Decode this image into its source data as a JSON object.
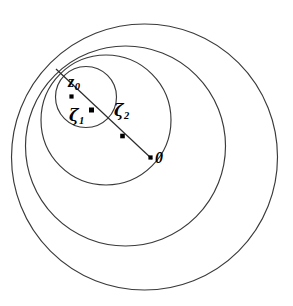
{
  "figure": {
    "kind": "geometry-diagram",
    "canvas": {
      "width": 293,
      "height": 306,
      "background": "#ffffff"
    },
    "stroke_color": "#3a3a3a",
    "marker_color": "#000000",
    "tangency_point": {
      "x": 55.0,
      "y": 68.0
    }
  },
  "circles": [
    {
      "name": "circle-z0",
      "cx": 86.0,
      "cy": 97.0,
      "r": 30.5,
      "label_ref": "z0"
    },
    {
      "name": "circle-zeta1",
      "cx": 106.0,
      "cy": 120.0,
      "r": 65.0,
      "label_ref": "zeta1"
    },
    {
      "name": "circle-zeta2",
      "cx": 125.5,
      "cy": 146.0,
      "r": 100.0,
      "label_ref": "zeta2"
    },
    {
      "name": "circle-zero",
      "cx": 144.5,
      "cy": 157.0,
      "r": 133.0,
      "label_ref": "zero"
    }
  ],
  "radial_line": {
    "name": "center-ray",
    "x1": 56.0,
    "y1": 69.0,
    "x2": 152.0,
    "y2": 159.0
  },
  "points": [
    {
      "id": "z0",
      "x": 71.5,
      "y": 96.5,
      "size": 4.2
    },
    {
      "id": "zeta1",
      "x": 91.5,
      "y": 110.0,
      "size": 5.0
    },
    {
      "id": "zeta2",
      "x": 122.5,
      "y": 136.0,
      "size": 4.6
    },
    {
      "id": "zero",
      "x": 150.5,
      "y": 157.5,
      "size": 4.2
    }
  ],
  "labels": {
    "z0": {
      "base": "z",
      "sub": "0"
    },
    "zeta1": {
      "base": "ζ",
      "sub": "1"
    },
    "zeta2": {
      "base": "ζ",
      "sub": "2"
    },
    "zero": {
      "base": "0",
      "sub": ""
    }
  }
}
